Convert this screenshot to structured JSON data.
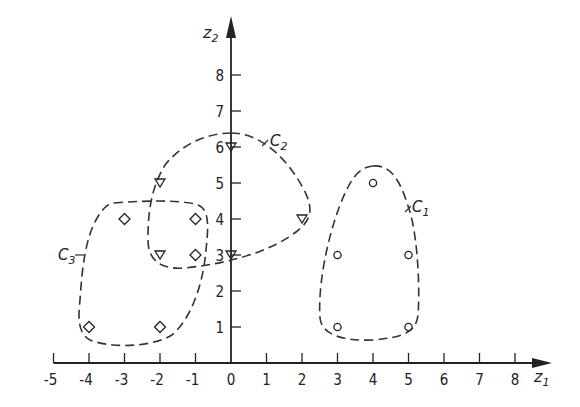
{
  "chart_data": {
    "type": "scatter",
    "title": "",
    "xlabel": "z1",
    "ylabel": "z2",
    "xlim": [
      -5,
      8
    ],
    "ylim": [
      0,
      8
    ],
    "x_ticks": [
      -5,
      -4,
      -3,
      -2,
      -1,
      0,
      1,
      2,
      3,
      4,
      5,
      6,
      7,
      8
    ],
    "y_ticks": [
      1,
      2,
      3,
      4,
      5,
      6,
      7,
      8
    ],
    "grid": false,
    "legend": null,
    "series": [
      {
        "name": "C1",
        "marker": "circle",
        "points": [
          [
            4,
            5
          ],
          [
            3,
            3
          ],
          [
            5,
            3
          ],
          [
            3,
            1
          ],
          [
            5,
            1
          ]
        ]
      },
      {
        "name": "C2",
        "marker": "triangle-down",
        "points": [
          [
            0,
            6
          ],
          [
            -2,
            5
          ],
          [
            2,
            4
          ],
          [
            -2,
            3
          ],
          [
            0,
            3
          ]
        ]
      },
      {
        "name": "C3",
        "marker": "diamond",
        "points": [
          [
            -3,
            4
          ],
          [
            -1,
            4
          ],
          [
            -1,
            3
          ],
          [
            -4,
            1
          ],
          [
            -2,
            1
          ]
        ]
      }
    ],
    "annotations": [
      {
        "text": "C1",
        "description": "dashed boundary enclosing circle points"
      },
      {
        "text": "C2",
        "description": "dashed boundary enclosing triangle points"
      },
      {
        "text": "C3",
        "description": "dashed boundary enclosing diamond points"
      }
    ]
  },
  "axes": {
    "x_name": "z",
    "x_sub": "1",
    "y_name": "z",
    "y_sub": "2"
  },
  "clusters": {
    "c1": {
      "name": "C",
      "sub": "1"
    },
    "c2": {
      "name": "C",
      "sub": "2"
    },
    "c3": {
      "name": "C",
      "sub": "3"
    }
  }
}
